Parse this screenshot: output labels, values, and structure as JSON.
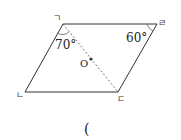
{
  "figure": {
    "type": "parallelogram",
    "vertices": [
      {
        "id": "A",
        "label": "ㄱ",
        "x": 63,
        "y": 24,
        "lx": 53,
        "ly": 21
      },
      {
        "id": "B",
        "label": "ㄹ",
        "x": 157,
        "y": 24,
        "lx": 158,
        "ly": 26
      },
      {
        "id": "C",
        "label": "ㄷ",
        "x": 118,
        "y": 92,
        "lx": 117,
        "ly": 102
      },
      {
        "id": "D",
        "label": "ㄴ",
        "x": 25,
        "y": 92,
        "lx": 16,
        "ly": 98
      }
    ],
    "angles": [
      {
        "value": "70°",
        "at": "ㄱ",
        "x": 55,
        "y": 49
      },
      {
        "value": "60°",
        "at": "ㄹ",
        "x": 126,
        "y": 42
      }
    ],
    "diagonal": {
      "from": "ㄱ",
      "to": "ㄷ",
      "style": "dashed"
    },
    "point": {
      "label": "O",
      "x": 91,
      "y": 59,
      "lx": 80,
      "ly": 67
    }
  },
  "answer": {
    "open_paren": "("
  }
}
